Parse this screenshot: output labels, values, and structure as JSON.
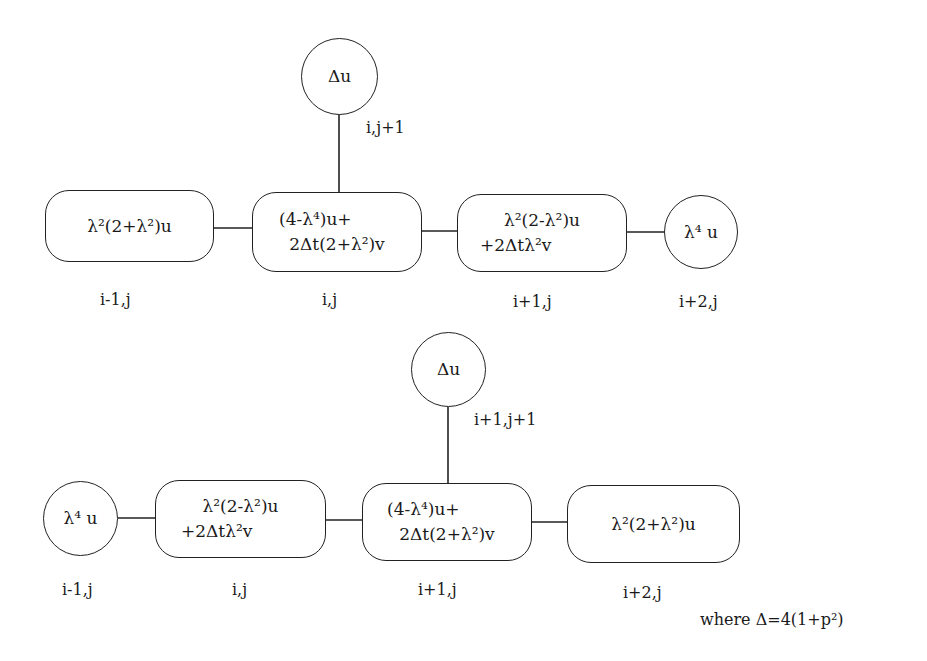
{
  "diagram": {
    "top_stencil": {
      "top_node": {
        "text": "Δu",
        "label": "i,j+1"
      },
      "nodes": [
        {
          "id": "t1",
          "line1": "λ²(2+λ²)u",
          "line2": "",
          "label": "i-1,j",
          "shape": "rounded-box"
        },
        {
          "id": "t2",
          "line1": "(4-λ⁴)u+",
          "line2": "2Δt(2+λ²)v",
          "label": "i,j",
          "shape": "rounded-box"
        },
        {
          "id": "t3",
          "line1": "λ²(2-λ²)u",
          "line2": "+2Δtλ²v",
          "label": "i+1,j",
          "shape": "rounded-box"
        },
        {
          "id": "t4",
          "line1": "λ⁴ u",
          "line2": "",
          "label": "i+2,j",
          "shape": "circle"
        }
      ]
    },
    "bottom_stencil": {
      "top_node": {
        "text": "Δu",
        "label": "i+1,j+1"
      },
      "nodes": [
        {
          "id": "b1",
          "line1": "λ⁴ u",
          "line2": "",
          "label": "i-1,j",
          "shape": "circle"
        },
        {
          "id": "b2",
          "line1": "λ²(2-λ²)u",
          "line2": "+2Δtλ²v",
          "label": "i,j",
          "shape": "rounded-box"
        },
        {
          "id": "b3",
          "line1": "(4-λ⁴)u+",
          "line2": "2Δt(2+λ²)v",
          "label": "i+1,j",
          "shape": "rounded-box"
        },
        {
          "id": "b4",
          "line1": "λ²(2+λ²)u",
          "line2": "",
          "label": "i+2,j",
          "shape": "rounded-box"
        }
      ]
    },
    "footnote": "where Δ=4(1+p²)",
    "colors": {
      "stroke": "#222222",
      "text": "#1a1a1a",
      "background": "#ffffff"
    }
  }
}
